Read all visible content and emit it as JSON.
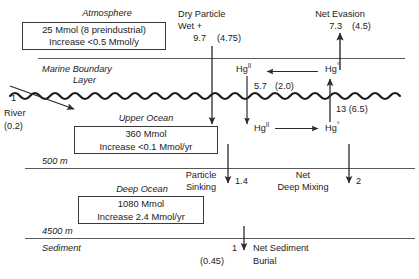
{
  "diagram": {
    "units_note": "Mmol and Mmol/yr",
    "colors": {
      "stroke": "#3a3a3a",
      "text": "#1b1b1b",
      "background": "#ffffff"
    }
  },
  "atmosphere": {
    "heading": "Atmosphere",
    "box_line1": "25 Mmol (8 preindustrial)",
    "box_line2": "Increase <0.5 Mmol/y"
  },
  "marine_boundary": {
    "line1": "Marine Boundary",
    "line2": "Layer"
  },
  "upper_ocean": {
    "heading": "Upper Ocean",
    "box_line1": "360 Mmol",
    "box_line2": "Increase <0.1 Mmol/yr"
  },
  "deep_ocean": {
    "heading": "Deep Ocean",
    "box_line1": "1080 Mmol",
    "box_line2": "Increase 2.4 Mmol/yr"
  },
  "depths": {
    "upper_boundary": "500 m",
    "lower_boundary": "4500 m",
    "sediment": "Sediment"
  },
  "fluxes": {
    "river": {
      "label": "River",
      "value": "1",
      "paren": "(0.2)"
    },
    "deposition": {
      "label_line1": "Dry Particle",
      "label_line2": "Wet +",
      "value": "9.7",
      "paren": "(4.75)"
    },
    "net_evasion": {
      "label": "Net Evasion",
      "value": "7.3",
      "paren": "(4.5)"
    },
    "mbl_reduction": {
      "value": "5.7",
      "paren": "(2.0)"
    },
    "sea_air_evasion": {
      "value": "13",
      "paren": "(6.5)"
    },
    "particle_sinking": {
      "label_line1": "Particle",
      "label_line2": "Sinking",
      "value": "1.4"
    },
    "net_deep_mixing": {
      "label_line1": "Net",
      "label_line2": "Deep Mixing",
      "value": "2"
    },
    "net_sediment_burial": {
      "label_line1": "Net Sediment",
      "label_line2": "Burial",
      "value": "1",
      "paren": "(0.45)"
    }
  },
  "species": {
    "hg2_mbl": "Hg",
    "hg2_mbl_sup": "II",
    "hg0_mbl": "Hg",
    "hg0_mbl_sup": "°",
    "hg2_ocean": "Hg",
    "hg2_ocean_sup": "II",
    "hg0_ocean": "Hg",
    "hg0_ocean_sup": "°"
  }
}
